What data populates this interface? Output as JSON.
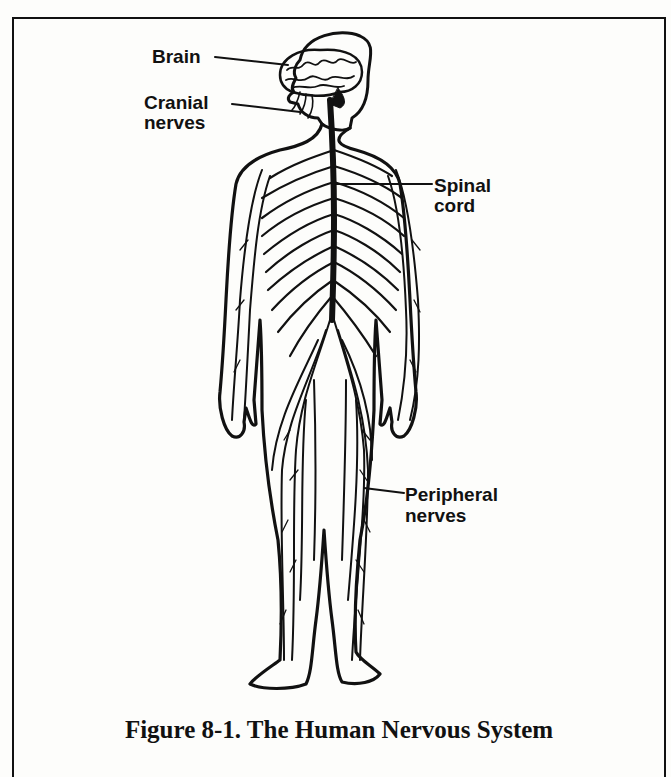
{
  "figure": {
    "caption": "Figure 8-1.  The Human Nervous System",
    "labels": {
      "brain": "Brain",
      "cranial_nerves_line1": "Cranial",
      "cranial_nerves_line2": "nerves",
      "spinal_cord_line1": "Spinal",
      "spinal_cord_line2": "cord",
      "peripheral_nerves_line1": "Peripheral",
      "peripheral_nerves_line2": "nerves"
    }
  },
  "colors": {
    "ink": "#111111",
    "paper": "#fdfdfb"
  }
}
